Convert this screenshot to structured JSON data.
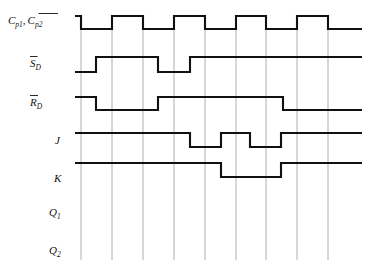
{
  "figure": {
    "title": "",
    "type": "timing-diagram",
    "width": 376,
    "height": 272,
    "background": "#ffffff",
    "line_color": "#111111",
    "grid_color": "#9a9a9a"
  },
  "labels": {
    "clock_c": "C",
    "clock_sub1": "p1",
    "clock_comma": ",",
    "clock_c2": "C",
    "clock_sub2": "p2",
    "sd_main": "S",
    "sd_sub": "D",
    "rd_main": "R",
    "rd_sub": "D",
    "j": "J",
    "k": "K",
    "q1_main": "Q",
    "q1_sub": "1",
    "q2_main": "Q",
    "q2_sub": "2"
  },
  "chart_data": {
    "type": "timing",
    "xlabel": "",
    "ylabel": "",
    "x_range": [
      75,
      362
    ],
    "gridlines": [
      81,
      112,
      143,
      174,
      205,
      236,
      266,
      297,
      328
    ],
    "grid_top": 18,
    "grid_bottom": 260,
    "signals": [
      {
        "name": "C_p1, C_p2_bar",
        "label_display": "C p1 , C p2 (overbar)",
        "row_high_y": 16,
        "row_low_y": 29,
        "start_level": "high",
        "transitions": [
          81,
          112,
          143,
          174,
          205,
          236,
          266,
          297,
          328
        ],
        "end_level": "low",
        "end_x": 362,
        "start_x": 75
      },
      {
        "name": "S_D_bar",
        "label_display": "S D (overbar)",
        "row_high_y": 57,
        "row_low_y": 72,
        "start_level": "low",
        "transitions": [
          96,
          158,
          190
        ],
        "end_level": "high",
        "end_x": 362,
        "start_x": 75
      },
      {
        "name": "R_D_bar",
        "label_display": "R D (overbar)",
        "row_high_y": 97,
        "row_low_y": 110,
        "start_level": "high",
        "transitions": [
          96,
          158,
          283
        ],
        "end_level": "low",
        "end_x": 362,
        "start_x": 75
      },
      {
        "name": "J",
        "label_display": "J",
        "row_high_y": 133,
        "row_low_y": 147,
        "start_level": "high",
        "transitions": [
          190,
          221,
          250,
          281
        ],
        "end_level": "high",
        "end_x": 362,
        "start_x": 75
      },
      {
        "name": "K",
        "label_display": "K",
        "row_high_y": 163,
        "row_low_y": 177,
        "start_level": "high",
        "transitions": [
          221,
          281
        ],
        "end_level": "high",
        "end_x": 362,
        "start_x": 75
      },
      {
        "name": "Q_1",
        "label_display": "Q 1",
        "row_high_y": 200,
        "row_low_y": 214,
        "start_level": "none",
        "transitions": [],
        "end_level": "none",
        "end_x": 362,
        "start_x": 75
      },
      {
        "name": "Q_2",
        "label_display": "Q 2",
        "row_high_y": 238,
        "row_low_y": 252,
        "start_level": "none",
        "transitions": [],
        "end_level": "none",
        "end_x": 362,
        "start_x": 75
      }
    ]
  }
}
